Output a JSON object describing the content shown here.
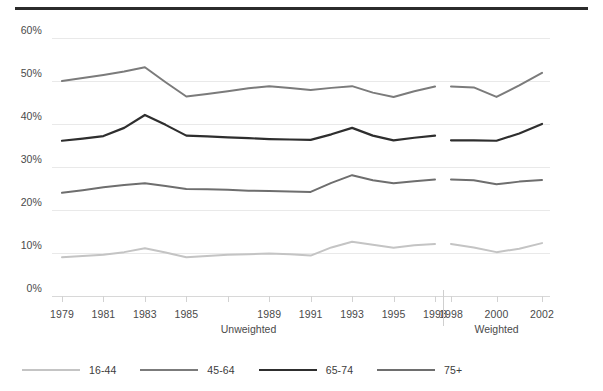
{
  "chart_data": {
    "type": "line",
    "title": "",
    "subtitle": "",
    "xlabel": "",
    "ylabel": "",
    "ylim": [
      0,
      60
    ],
    "ytick_values": [
      0,
      10,
      20,
      30,
      40,
      50,
      60
    ],
    "ytick_labels": [
      "0%",
      "10%",
      "20%",
      "30%",
      "40%",
      "50%",
      "60%"
    ],
    "grid": true,
    "legend_position": "bottom-left",
    "x_groups": [
      {
        "label": "Unweighted",
        "categories": [
          "1979",
          "1980",
          "1981",
          "1982",
          "1983",
          "1984",
          "1985",
          "1986",
          "1987",
          "1988",
          "1989",
          "1990",
          "1991",
          "1992",
          "1993",
          "1994",
          "1995",
          "1996",
          "1998"
        ]
      },
      {
        "label": "Weighted",
        "categories": [
          "1998",
          "1999",
          "2000",
          "2001",
          "2002"
        ]
      }
    ],
    "xtick_labels": [
      "1979",
      "1981",
      "1983",
      "1985",
      "1989",
      "1991",
      "1993",
      "1995",
      "1998",
      "1998",
      "2000",
      "2002"
    ],
    "series": [
      {
        "name": "16-44",
        "color": "#c4c4c4",
        "width": 2.0,
        "unweighted": [
          9.0,
          9.3,
          9.6,
          10.2,
          11.1,
          10.1,
          9.0,
          9.3,
          9.6,
          9.7,
          9.9,
          9.7,
          9.4,
          11.3,
          12.6,
          11.9,
          11.2,
          11.8,
          12.1
        ],
        "weighted": [
          12.1,
          11.3,
          10.2,
          11.0,
          12.3
        ]
      },
      {
        "name": "45-64",
        "color": "#7b7b7b",
        "width": 2.0,
        "unweighted": [
          50.0,
          50.7,
          51.4,
          52.2,
          53.2,
          49.7,
          46.4,
          47.0,
          47.6,
          48.3,
          48.8,
          48.4,
          47.9,
          48.4,
          48.8,
          47.3,
          46.3,
          47.6,
          48.7
        ],
        "weighted": [
          48.7,
          48.5,
          46.3,
          49.0,
          51.9
        ]
      },
      {
        "name": "65-74",
        "color": "#2e2e2e",
        "width": 2.2,
        "unweighted": [
          36.1,
          36.6,
          37.2,
          39.1,
          42.1,
          39.8,
          37.3,
          37.1,
          36.9,
          36.7,
          36.5,
          36.4,
          36.3,
          37.6,
          39.1,
          37.3,
          36.2,
          36.8,
          37.3
        ],
        "weighted": [
          36.2,
          36.2,
          36.1,
          37.8,
          40.0
        ]
      },
      {
        "name": "75+",
        "color": "#6e6e6e",
        "width": 2.0,
        "unweighted": [
          24.0,
          24.6,
          25.3,
          25.8,
          26.2,
          25.6,
          24.9,
          24.8,
          24.7,
          24.5,
          24.4,
          24.3,
          24.2,
          26.3,
          28.1,
          26.9,
          26.2,
          26.7,
          27.1
        ],
        "weighted": [
          27.1,
          26.9,
          26.0,
          26.6,
          27.0
        ]
      }
    ]
  },
  "legend": {
    "items": [
      {
        "label": "16-44",
        "color": "#c4c4c4",
        "width": 2.0
      },
      {
        "label": "45-64",
        "color": "#7b7b7b",
        "width": 2.0
      },
      {
        "label": "65-74",
        "color": "#2e2e2e",
        "width": 2.2
      },
      {
        "label": "75+",
        "color": "#6e6e6e",
        "width": 2.0
      }
    ]
  },
  "axis": {
    "group_unweighted": "Unweighted",
    "group_weighted": "Weighted"
  }
}
